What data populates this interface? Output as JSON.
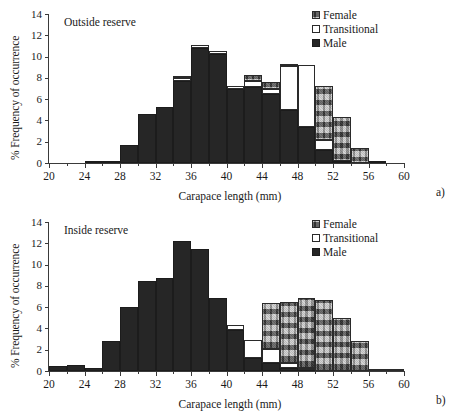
{
  "figure": {
    "xlabel": "Carapace length (mm)",
    "ylabel": "% Frequency of occurrence",
    "legend": {
      "female": "Female",
      "transitional": "Transitional",
      "male": "Male"
    },
    "colors": {
      "male": "#262626",
      "transitional": "#ffffff",
      "female": "#9a9a9a",
      "axis": "#3a3a3a"
    },
    "panel_a_tag": "a)",
    "panel_b_tag": "b)",
    "panel_a_note": "Outside reserve",
    "panel_b_note": "Inside reserve"
  },
  "chart_data": [
    {
      "type": "bar",
      "id": "panel-a",
      "title": "Outside reserve",
      "annotation": "a)",
      "xlabel": "Carapace length (mm)",
      "ylabel": "% Frequency of occurrence",
      "xlim": [
        20,
        60
      ],
      "ylim": [
        0,
        14
      ],
      "ytick_step": 2,
      "yticks": [
        0,
        2,
        4,
        6,
        8,
        10,
        12,
        14
      ],
      "xticks": [
        20,
        24,
        28,
        32,
        36,
        40,
        44,
        48,
        52,
        56,
        60
      ],
      "xtick_minor_step": 2,
      "grid": false,
      "stacked": true,
      "legend_position": "top-right",
      "bin_width": 2,
      "bin_starts": [
        20,
        22,
        24,
        26,
        28,
        30,
        32,
        34,
        36,
        38,
        40,
        42,
        44,
        46,
        48,
        50,
        52,
        54,
        56,
        58
      ],
      "bin_labels": [
        "20-22",
        "22-24",
        "24-26",
        "26-28",
        "28-30",
        "30-32",
        "32-34",
        "34-36",
        "36-38",
        "38-40",
        "40-42",
        "42-44",
        "44-46",
        "46-48",
        "48-50",
        "50-52",
        "52-54",
        "54-56",
        "56-58",
        "58-60"
      ],
      "series": [
        {
          "name": "Male",
          "values": [
            0,
            0,
            0.1,
            0.15,
            1.7,
            4.6,
            5.3,
            7.7,
            10.85,
            10.2,
            7.0,
            7.1,
            6.5,
            5.0,
            3.4,
            1.2,
            0.15,
            0,
            0.1,
            0
          ]
        },
        {
          "name": "Transitional",
          "values": [
            0,
            0,
            0,
            0,
            0,
            0,
            0,
            0.3,
            0.25,
            0.35,
            0.25,
            0.6,
            0.5,
            4.1,
            5.8,
            1.0,
            0,
            0,
            0,
            0
          ]
        },
        {
          "name": "Female",
          "values": [
            0,
            0,
            0,
            0,
            0,
            0,
            0,
            0.1,
            0,
            0,
            0,
            0.55,
            0.6,
            0.1,
            0,
            5.0,
            4.2,
            1.4,
            0,
            0
          ]
        }
      ],
      "totals": [
        0,
        0,
        0.1,
        0.15,
        1.7,
        4.6,
        5.3,
        8.1,
        11.1,
        10.55,
        7.25,
        8.25,
        7.6,
        9.2,
        9.2,
        8.8,
        7.2,
        4.35,
        1.5,
        0.15
      ]
    },
    {
      "type": "bar",
      "id": "panel-b",
      "title": "Inside reserve",
      "annotation": "b)",
      "xlabel": "Carapace length (mm)",
      "ylabel": "% Frequency of occurrence",
      "xlim": [
        20,
        60
      ],
      "ylim": [
        0,
        14
      ],
      "ytick_step": 2,
      "yticks": [
        0,
        2,
        4,
        6,
        8,
        10,
        12,
        14
      ],
      "xticks": [
        20,
        24,
        28,
        32,
        36,
        40,
        44,
        48,
        52,
        56,
        60
      ],
      "xtick_minor_step": 2,
      "grid": false,
      "stacked": true,
      "legend_position": "top-right",
      "bin_width": 2,
      "bin_starts": [
        20,
        22,
        24,
        26,
        28,
        30,
        32,
        34,
        36,
        38,
        40,
        42,
        44,
        46,
        48,
        50,
        52,
        54,
        56,
        58
      ],
      "bin_labels": [
        "20-22",
        "22-24",
        "24-26",
        "26-28",
        "28-30",
        "30-32",
        "32-34",
        "34-36",
        "36-38",
        "38-40",
        "40-42",
        "42-44",
        "44-46",
        "46-48",
        "48-50",
        "50-52",
        "52-54",
        "54-56",
        "56-58",
        "58-60"
      ],
      "series": [
        {
          "name": "Male",
          "values": [
            0.5,
            0.6,
            0.3,
            2.8,
            6.05,
            8.5,
            8.7,
            12.2,
            11.5,
            6.9,
            3.9,
            1.2,
            0.8,
            0.3,
            0.1,
            0,
            0,
            0,
            0,
            0
          ]
        },
        {
          "name": "Transitional",
          "values": [
            0,
            0,
            0,
            0,
            0,
            0,
            0,
            0,
            0,
            0,
            0.45,
            1.7,
            1.3,
            0.5,
            0.2,
            0,
            0,
            0,
            0,
            0
          ]
        },
        {
          "name": "Female",
          "values": [
            0,
            0,
            0,
            0,
            0,
            0,
            0,
            0,
            0,
            0,
            0,
            0,
            4.25,
            5.65,
            6.6,
            6.65,
            5.0,
            2.8,
            0.1,
            0.1
          ]
        }
      ],
      "totals": [
        0.5,
        0.6,
        0.3,
        2.8,
        6.05,
        8.5,
        8.7,
        12.2,
        11.5,
        6.9,
        4.35,
        2.9,
        6.35,
        6.45,
        6.9,
        6.65,
        5.0,
        2.8,
        0.1,
        0.1
      ]
    }
  ]
}
